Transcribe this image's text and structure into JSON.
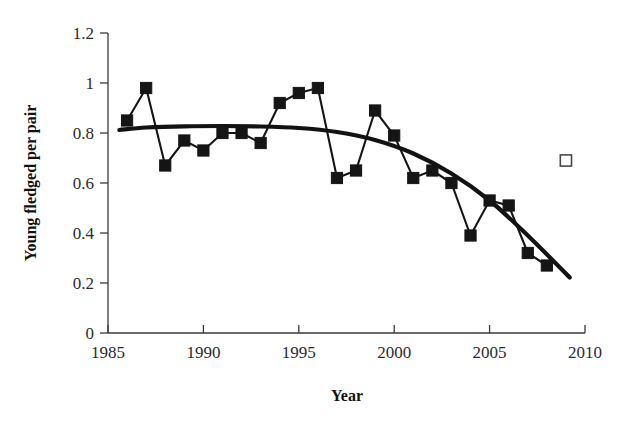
{
  "chart_data": {
    "type": "line",
    "title": "",
    "xlabel": "Year",
    "ylabel": "Young fledged per pair",
    "xlim": [
      1985,
      2010
    ],
    "ylim": [
      0,
      1.2
    ],
    "xticks": [
      1985,
      1990,
      1995,
      2000,
      2005,
      2010
    ],
    "xtick_labels": [
      "1985",
      "1990",
      "1995",
      "2000",
      "2005",
      "2010"
    ],
    "yticks": [
      0,
      0.2,
      0.4,
      0.6,
      0.8,
      1,
      1.2
    ],
    "ytick_labels": [
      "0",
      "0.2",
      "0.4",
      "0.6",
      "0.8",
      "1",
      "1.2"
    ],
    "grid": false,
    "legend": "none",
    "series": [
      {
        "name": "Young fledged per pair",
        "marker": "filled-square",
        "x": [
          1986,
          1987,
          1988,
          1989,
          1990,
          1991,
          1992,
          1993,
          1994,
          1995,
          1996,
          1997,
          1998,
          1999,
          2000,
          2001,
          2002,
          2003,
          2004,
          2005,
          2006,
          2007,
          2008
        ],
        "values": [
          0.85,
          0.98,
          0.67,
          0.77,
          0.73,
          0.8,
          0.8,
          0.76,
          0.92,
          0.96,
          0.98,
          0.62,
          0.65,
          0.89,
          0.79,
          0.62,
          0.65,
          0.6,
          0.39,
          0.53,
          0.51,
          0.32,
          0.27
        ]
      },
      {
        "name": "Open marker",
        "marker": "open-square",
        "x": [
          2009
        ],
        "values": [
          0.69
        ]
      },
      {
        "name": "Trend curve",
        "marker": "none",
        "x": [
          1985.6,
          1987,
          1989,
          1991,
          1993,
          1995,
          1997,
          1999,
          2001,
          2003,
          2005,
          2007,
          2009.2
        ],
        "values": [
          0.812,
          0.822,
          0.827,
          0.828,
          0.826,
          0.82,
          0.804,
          0.772,
          0.718,
          0.638,
          0.53,
          0.39,
          0.222
        ]
      }
    ]
  },
  "axes": {
    "x_title": "Year",
    "y_title": "Young fledged per pair"
  }
}
